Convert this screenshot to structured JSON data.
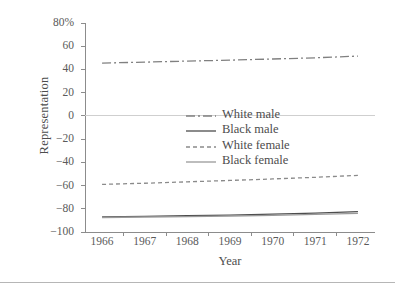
{
  "chart_data": {
    "type": "line",
    "title": "",
    "xlabel": "Year",
    "ylabel": "Representation",
    "x": [
      1966,
      1967,
      1968,
      1969,
      1970,
      1971,
      1972
    ],
    "xlim": [
      1965.6,
      1972.4
    ],
    "ylim": [
      -100,
      80
    ],
    "yticks": [
      80,
      60,
      40,
      20,
      0,
      -20,
      -40,
      -60,
      -80,
      -100
    ],
    "ytick_labels": [
      "80%",
      "60",
      "40",
      "20",
      "0",
      "−20",
      "−40",
      "−60",
      "−80",
      "−100"
    ],
    "xtick_labels": [
      "1966",
      "1967",
      "1968",
      "1969",
      "1970",
      "1971",
      "1972"
    ],
    "grid": false,
    "zero_line": true,
    "legend_position": "center",
    "series": [
      {
        "name": "White male",
        "style": "dash-dot",
        "color": "#808080",
        "values": [
          45.5,
          46.3,
          47.2,
          48.0,
          49.0,
          50.0,
          51.5
        ]
      },
      {
        "name": "Black male",
        "style": "solid",
        "color": "#4d4d4d",
        "values": [
          -87.0,
          -86.5,
          -86.0,
          -85.4,
          -84.6,
          -83.7,
          -82.5
        ]
      },
      {
        "name": "White female",
        "style": "dashed",
        "color": "#8a8a8a",
        "values": [
          -59.0,
          -58.0,
          -56.8,
          -55.6,
          -54.3,
          -52.9,
          -51.2
        ]
      },
      {
        "name": "Black female",
        "style": "solid",
        "color": "#9a9a9a",
        "values": [
          -87.5,
          -87.1,
          -86.7,
          -86.2,
          -85.6,
          -84.9,
          -83.9
        ]
      }
    ]
  },
  "legend": {
    "items": [
      {
        "label": "White male"
      },
      {
        "label": "Black male"
      },
      {
        "label": "White female"
      },
      {
        "label": "Black female"
      }
    ]
  },
  "colors": {
    "axis": "#8c8c8c",
    "text": "#4d4d4d",
    "zero_line": "#cfcfcf",
    "footer_rule": "#b6b6b6"
  }
}
